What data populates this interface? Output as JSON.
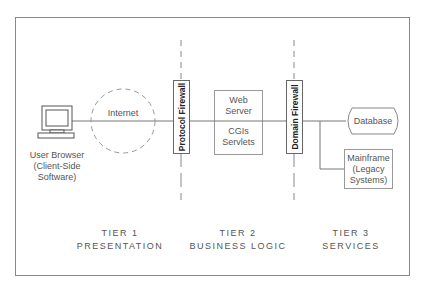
{
  "diagram": {
    "nodes": {
      "browser": {
        "line1": "User Browser",
        "line2": "(Client-Side",
        "line3": "Software)",
        "icon": "computer-icon"
      },
      "internet": {
        "label": "Internet"
      },
      "protocol_firewall": {
        "label": "Protocol Firewall"
      },
      "web_server": {
        "top_line1": "Web",
        "top_line2": "Server",
        "bottom_line1": "CGIs",
        "bottom_line2": "Servlets"
      },
      "domain_firewall": {
        "label": "Domain Firewall"
      },
      "database": {
        "label": "Database"
      },
      "mainframe": {
        "line1": "Mainframe",
        "line2": "(Legacy",
        "line3": "Systems)"
      }
    },
    "tiers": [
      {
        "name": "TIER 1",
        "desc": "PRESENTATION"
      },
      {
        "name": "TIER 2",
        "desc": "BUSINESS LOGIC"
      },
      {
        "name": "TIER 3",
        "desc": "SERVICES"
      }
    ],
    "colors": {
      "line": "#777777",
      "border": "#888888",
      "text": "#555555"
    }
  }
}
